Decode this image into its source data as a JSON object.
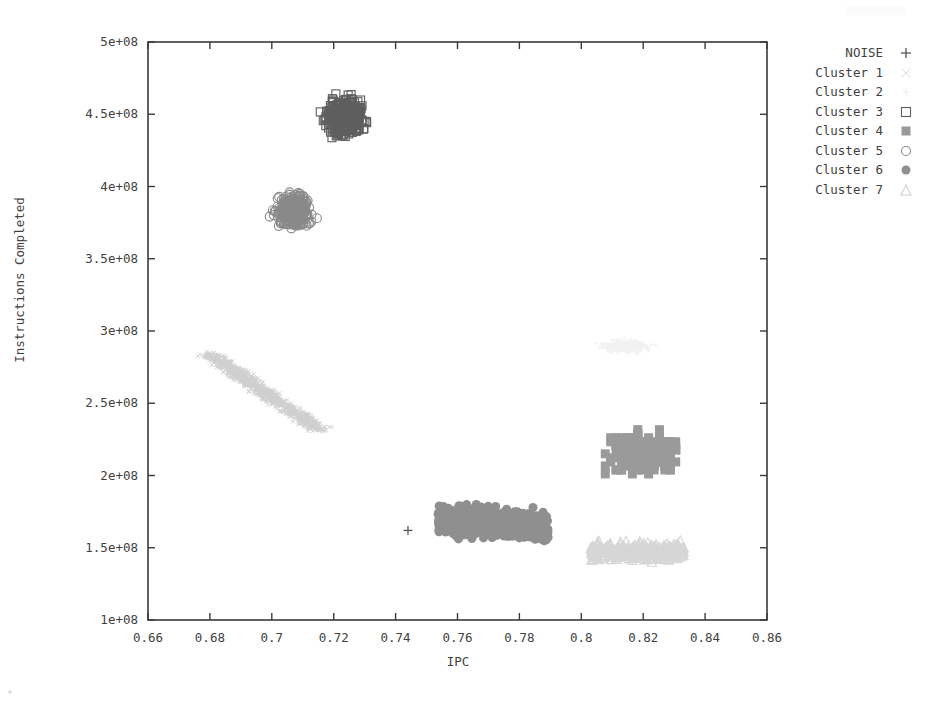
{
  "chart_data": {
    "type": "scatter",
    "title": "",
    "xlabel": "IPC",
    "ylabel": "Instructions Completed",
    "xlim": [
      0.66,
      0.86
    ],
    "ylim": [
      100000000,
      500000000
    ],
    "xticks": [
      "0.66",
      "0.68",
      "0.7",
      "0.72",
      "0.74",
      "0.76",
      "0.78",
      "0.8",
      "0.82",
      "0.84",
      "0.86"
    ],
    "xtick_values": [
      0.66,
      0.68,
      0.7,
      0.72,
      0.74,
      0.76,
      0.78,
      0.8,
      0.82,
      0.84,
      0.86
    ],
    "yticks": [
      "1e+08",
      "1.5e+08",
      "2e+08",
      "2.5e+08",
      "3e+08",
      "3.5e+08",
      "4e+08",
      "4.5e+08",
      "5e+08"
    ],
    "ytick_values": [
      100000000,
      150000000,
      200000000,
      250000000,
      300000000,
      350000000,
      400000000,
      450000000,
      500000000
    ],
    "grid": false,
    "legend_position": "top-right-outside",
    "series": [
      {
        "name": "NOISE",
        "marker": "plus",
        "color": "#555555",
        "size": 9,
        "count": 1,
        "x_range": [
          0.7435,
          0.7445
        ],
        "y_range": [
          161000000,
          163000000
        ],
        "points": [
          [
            0.744,
            162000000.0
          ]
        ]
      },
      {
        "name": "Cluster 1",
        "marker": "cross-thin",
        "color": "#cfcfcf",
        "size": 4,
        "count": 900,
        "shape": "diagonal-band",
        "x_range": [
          0.6785,
          0.7165
        ],
        "y_range": [
          228000000,
          288000000
        ],
        "band": {
          "x0": 0.68,
          "y0": 284000000.0,
          "x1": 0.715,
          "y1": 232000000.0,
          "thickness": 0.0045
        }
      },
      {
        "name": "Cluster 2",
        "marker": "star-faint",
        "color": "#f2f2f2",
        "size": 4,
        "count": 260,
        "shape": "blob",
        "x_range": [
          0.802,
          0.827
        ],
        "y_range": [
          283000000,
          296000000
        ],
        "center": [
          0.8145,
          289500000.0
        ]
      },
      {
        "name": "Cluster 3",
        "marker": "open-square",
        "color": "#5f5f5f",
        "size": 8,
        "count": 420,
        "shape": "blob",
        "x_range": [
          0.713,
          0.732
        ],
        "y_range": [
          428000000,
          466000000
        ],
        "center": [
          0.7235,
          448000000.0
        ]
      },
      {
        "name": "Cluster 4",
        "marker": "filled-square",
        "color": "#9a9a9a",
        "size": 9,
        "count": 300,
        "shape": "blocky",
        "x_range": [
          0.8045,
          0.836
        ],
        "y_range": [
          193000000,
          232000000
        ],
        "center": [
          0.82,
          215000000.0
        ]
      },
      {
        "name": "Cluster 5",
        "marker": "open-circle",
        "color": "#8a8a8a",
        "size": 9,
        "count": 330,
        "shape": "blob",
        "x_range": [
          0.6985,
          0.7155
        ],
        "y_range": [
          366000000,
          400000000
        ],
        "center": [
          0.707,
          383000000.0
        ]
      },
      {
        "name": "Cluster 6",
        "marker": "filled-circle",
        "color": "#8f8f8f",
        "size": 9,
        "count": 700,
        "shape": "elongated",
        "x_range": [
          0.753,
          0.7905
        ],
        "y_range": [
          152000000,
          181000000
        ],
        "center": [
          0.7715,
          167000000.0
        ]
      },
      {
        "name": "Cluster 7",
        "marker": "open-triangle",
        "color": "#d6d6d6",
        "size": 9,
        "count": 400,
        "shape": "flat-band",
        "x_range": [
          0.804,
          0.836
        ],
        "y_range": [
          138000000,
          156000000
        ],
        "center": [
          0.818,
          147500000.0
        ]
      }
    ]
  },
  "axes": {
    "x_axis_label": "IPC",
    "y_axis_label": "Instructions Completed"
  },
  "legend": {
    "entries": [
      {
        "label": "NOISE",
        "marker": "plus-icon"
      },
      {
        "label": "Cluster 1",
        "marker": "cross-thin-icon"
      },
      {
        "label": "Cluster 2",
        "marker": "star-faint-icon"
      },
      {
        "label": "Cluster 3",
        "marker": "open-square-icon"
      },
      {
        "label": "Cluster 4",
        "marker": "filled-square-icon"
      },
      {
        "label": "Cluster 5",
        "marker": "open-circle-icon"
      },
      {
        "label": "Cluster 6",
        "marker": "filled-circle-icon"
      },
      {
        "label": "Cluster 7",
        "marker": "open-triangle-icon"
      }
    ]
  },
  "colors": {
    "axis": "#3a3a3a",
    "background": "#ffffff",
    "cluster1": "#cfcfcf",
    "cluster2": "#f2f2f2",
    "cluster3": "#5f5f5f",
    "cluster4": "#9a9a9a",
    "cluster5": "#8a8a8a",
    "cluster6": "#8f8f8f",
    "cluster7": "#d6d6d6",
    "noise": "#555555"
  }
}
